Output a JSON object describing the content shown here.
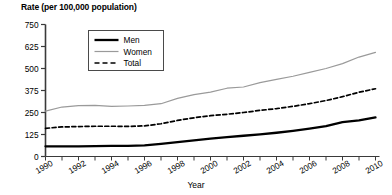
{
  "chart_data": {
    "type": "line",
    "title": "Rate (per 100,000 population)",
    "xlabel": "Year",
    "ylabel": "Rate (per 100,000 population)",
    "xlim": [
      1990,
      2010
    ],
    "ylim": [
      0,
      750
    ],
    "ytick_labels": [
      "0",
      "125",
      "250",
      "375",
      "500",
      "625",
      "750"
    ],
    "ytick_values": [
      0,
      125,
      250,
      375,
      500,
      625,
      750
    ],
    "xtick_labels": [
      "1990",
      "1992",
      "1994",
      "1996",
      "1998",
      "2000",
      "2002",
      "2004",
      "2006",
      "2008",
      "2010"
    ],
    "xtick_values": [
      1990,
      1992,
      1994,
      1996,
      1998,
      2000,
      2002,
      2004,
      2006,
      2008,
      2010
    ],
    "minor_xticks": [
      1990,
      1991,
      1992,
      1993,
      1994,
      1995,
      1996,
      1997,
      1998,
      1999,
      2000,
      2001,
      2002,
      2003,
      2004,
      2005,
      2006,
      2007,
      2008,
      2009,
      2010
    ],
    "grid": false,
    "legend_position": "upper-left-inside",
    "x": [
      1990,
      1991,
      1992,
      1993,
      1994,
      1995,
      1996,
      1997,
      1998,
      1999,
      2000,
      2001,
      2002,
      2003,
      2004,
      2005,
      2006,
      2007,
      2008,
      2009,
      2010
    ],
    "series": [
      {
        "name": "Men",
        "style": "solid-thick",
        "color": "#000000",
        "values": [
          58,
          58,
          58,
          59,
          60,
          60,
          63,
          72,
          82,
          92,
          102,
          110,
          118,
          126,
          135,
          146,
          158,
          172,
          195,
          205,
          222
        ]
      },
      {
        "name": "Women",
        "style": "solid-thin",
        "color": "#9a9a9a",
        "values": [
          258,
          281,
          289,
          291,
          285,
          287,
          290,
          300,
          330,
          352,
          366,
          388,
          395,
          420,
          438,
          456,
          478,
          500,
          528,
          565,
          592
        ]
      },
      {
        "name": "Total",
        "style": "dashed",
        "color": "#000000",
        "values": [
          160,
          168,
          170,
          172,
          172,
          171,
          174,
          186,
          205,
          220,
          232,
          240,
          250,
          262,
          272,
          285,
          300,
          318,
          340,
          365,
          385
        ]
      }
    ]
  }
}
